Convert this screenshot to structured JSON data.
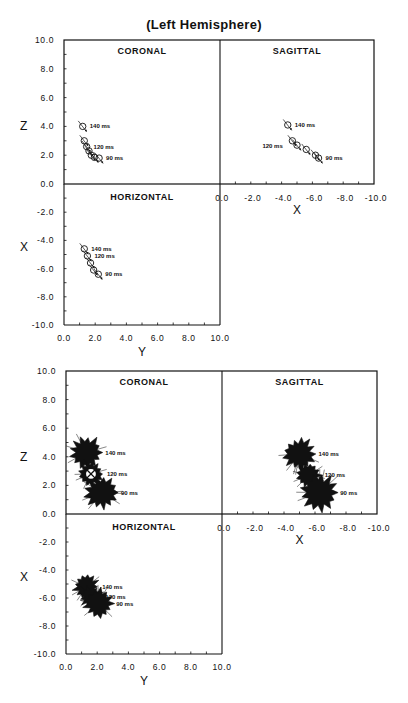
{
  "figure": {
    "cut_title": "",
    "title": "(Left Hemisphere)"
  },
  "chart_data": [
    {
      "type": "scatter",
      "title": "(Left Hemisphere)",
      "subtitle": "Dipole locations over time (individual traces, circles with direction bars)",
      "marker": "circle-with-orientation",
      "panels": [
        {
          "name": "CORONAL",
          "xlabel": "Y",
          "ylabel": "Z",
          "xlim": [
            0,
            10
          ],
          "ylim": [
            0,
            10
          ],
          "points": [
            {
              "x": 1.2,
              "y": 4.0,
              "label": "140 ms"
            },
            {
              "x": 1.3,
              "y": 3.0
            },
            {
              "x": 1.45,
              "y": 2.6,
              "label": "120 ms"
            },
            {
              "x": 1.6,
              "y": 2.3
            },
            {
              "x": 1.75,
              "y": 2.0
            },
            {
              "x": 1.95,
              "y": 1.85
            },
            {
              "x": 2.25,
              "y": 1.8,
              "label": "90 ms"
            }
          ]
        },
        {
          "name": "SAGITTAL",
          "xlabel": "X",
          "ylabel": "Z",
          "xlim": [
            0,
            -10
          ],
          "ylim": [
            0,
            10
          ],
          "points": [
            {
              "x": -4.4,
              "y": 4.1,
              "label": "140 ms"
            },
            {
              "x": -4.7,
              "y": 3.0,
              "label": "120 ms"
            },
            {
              "x": -5.0,
              "y": 2.7
            },
            {
              "x": -5.6,
              "y": 2.4
            },
            {
              "x": -6.2,
              "y": 2.0
            },
            {
              "x": -6.4,
              "y": 1.8,
              "label": "90 ms"
            }
          ]
        },
        {
          "name": "HORIZONTAL",
          "xlabel": "Y",
          "ylabel": "X",
          "xlim": [
            0,
            10
          ],
          "ylim": [
            -10,
            0
          ],
          "points": [
            {
              "x": 1.3,
              "y": -4.6,
              "label": "140 ms"
            },
            {
              "x": 1.5,
              "y": -5.1,
              "label": "120 ms"
            },
            {
              "x": 1.7,
              "y": -5.6
            },
            {
              "x": 1.9,
              "y": -6.1
            },
            {
              "x": 2.2,
              "y": -6.4,
              "label": "90 ms"
            }
          ]
        }
      ]
    },
    {
      "type": "scatter",
      "title": "",
      "marker": "starburst-cluster",
      "panels": [
        {
          "name": "CORONAL",
          "xlabel": "Y",
          "ylabel": "Z",
          "xlim": [
            0,
            10
          ],
          "ylim": [
            0,
            10
          ],
          "clusters": [
            {
              "x": 1.3,
              "y": 4.3,
              "r": 0.9,
              "label": "140 ms",
              "hollow": false
            },
            {
              "x": 1.6,
              "y": 2.8,
              "r": 0.7,
              "label": "120 ms",
              "hollow": true
            },
            {
              "x": 2.3,
              "y": 1.5,
              "r": 0.9,
              "label": "90 ms",
              "hollow": false
            }
          ]
        },
        {
          "name": "SAGITTAL",
          "xlabel": "X",
          "ylabel": "Z",
          "xlim": [
            0,
            -10
          ],
          "ylim": [
            0,
            10
          ],
          "clusters": [
            {
              "x": -5.0,
              "y": 4.2,
              "r": 0.9,
              "label": "140 ms",
              "hollow": false
            },
            {
              "x": -5.6,
              "y": 2.7,
              "r": 0.7,
              "label": "120 ms",
              "hollow": false
            },
            {
              "x": -6.3,
              "y": 1.5,
              "r": 1.0,
              "label": "90 ms",
              "hollow": false
            }
          ]
        },
        {
          "name": "HORIZONTAL",
          "xlabel": "Y",
          "ylabel": "X",
          "xlim": [
            0,
            10
          ],
          "ylim": [
            -10,
            0
          ],
          "clusters": [
            {
              "x": 1.3,
              "y": -5.2,
              "r": 0.7,
              "label": "140 ms",
              "hollow": false
            },
            {
              "x": 1.6,
              "y": -5.9,
              "r": 0.6,
              "label": "120 ms",
              "hollow": false
            },
            {
              "x": 2.1,
              "y": -6.4,
              "r": 0.8,
              "label": "90 ms",
              "hollow": false
            }
          ]
        }
      ]
    }
  ],
  "ticks": {
    "z": [
      "10.0",
      "8.0",
      "6.0",
      "4.0",
      "2.0",
      "0.0"
    ],
    "x_horiz_left": [
      "-2.0",
      "-4.0",
      "-6.0",
      "-8.0",
      "-10.0"
    ],
    "y": [
      "0.0",
      "2.0",
      "4.0",
      "6.0",
      "8.0",
      "10.0"
    ],
    "x_sag": [
      "0.0",
      "-2.0",
      "-4.0",
      "-6.0",
      "-8.0",
      "-10.0"
    ]
  },
  "layout": [
    {
      "left": 64,
      "mid": 220,
      "right": 374,
      "top": 40,
      "zero": 184,
      "bottom": 325
    },
    {
      "left": 66,
      "mid": 222,
      "right": 377,
      "top": 371,
      "zero": 514,
      "bottom": 654
    }
  ]
}
